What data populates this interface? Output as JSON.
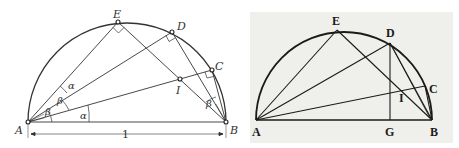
{
  "left_figure": {
    "points": {
      "A": {
        "label": "A",
        "x": 28,
        "y": 122
      },
      "B": {
        "label": "B",
        "x": 226,
        "y": 122
      },
      "C": {
        "label": "C",
        "x": 212,
        "y": 70
      },
      "D": {
        "label": "D",
        "x": 172,
        "y": 32
      },
      "E": {
        "label": "E",
        "x": 118,
        "y": 22
      },
      "I": {
        "label": "I",
        "x": 180,
        "y": 79
      }
    },
    "angles": {
      "alpha_top": "α",
      "beta_mid": "β",
      "beta_low": "β",
      "alpha_low": "α",
      "beta_B": "β"
    },
    "length_label": "1"
  },
  "right_figure": {
    "points": {
      "A": {
        "label": "A"
      },
      "B": {
        "label": "B"
      },
      "C": {
        "label": "C"
      },
      "D": {
        "label": "D"
      },
      "E": {
        "label": "E"
      },
      "G": {
        "label": "G"
      },
      "I": {
        "label": "I"
      }
    },
    "background": "#f0f0ee"
  }
}
